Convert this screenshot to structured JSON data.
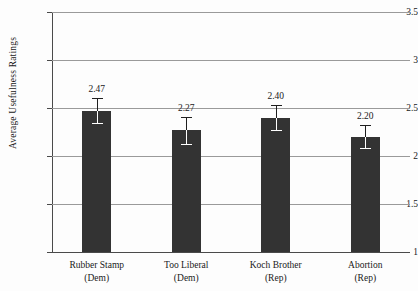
{
  "chart_data": {
    "type": "bar",
    "title": "",
    "xlabel": "",
    "ylabel": "Average Usefulness Ratings",
    "ylim": [
      1,
      3.5
    ],
    "yticks": [
      "1",
      "1.5",
      "2",
      "2.5",
      "3",
      "3.5"
    ],
    "ytick_values": [
      1,
      1.5,
      2,
      2.5,
      3,
      3.5
    ],
    "grid": true,
    "legend": "none",
    "bar_color": "#333333",
    "categories": [
      {
        "line1": "Rubber Stamp",
        "line2": "(Dem)"
      },
      {
        "line1": "Too Liberal",
        "line2": "(Dem)"
      },
      {
        "line1": "Koch Brother",
        "line2": "(Rep)"
      },
      {
        "line1": "Abortion",
        "line2": "(Rep)"
      }
    ],
    "values": [
      2.47,
      2.27,
      2.4,
      2.2
    ],
    "value_labels": [
      "2.47",
      "2.27",
      "2.40",
      "2.20"
    ],
    "errors": [
      0.13,
      0.14,
      0.13,
      0.12
    ]
  }
}
